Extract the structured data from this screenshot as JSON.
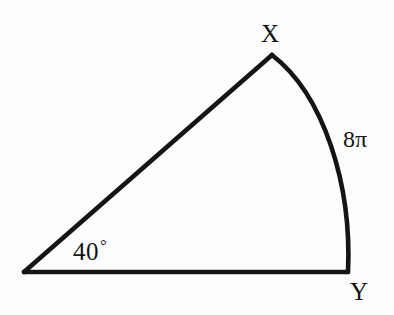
{
  "figure": {
    "kind": "circular-sector",
    "background_color": "#fdfdfd",
    "stroke_color": "#141414",
    "stroke_width": 4.6
  },
  "labels": {
    "vertex_x": "X",
    "vertex_y": "Y",
    "arc_length": "8π",
    "angle_measure": "40",
    "degree_symbol": "°"
  },
  "geometry": {
    "center_vertex": {
      "x": 24,
      "y": 272
    },
    "point_x": {
      "x": 272,
      "y": 55
    },
    "point_y": {
      "x": 348,
      "y": 272
    },
    "arc_outer_extent_x": 350,
    "arc_control_1": {
      "x": 324,
      "y": 95
    },
    "arc_control_2": {
      "x": 352,
      "y": 185
    },
    "central_angle_degrees": 40,
    "arc_length_value": "8π"
  },
  "label_positions": {
    "vertex_x": {
      "x": 261,
      "y": 21
    },
    "vertex_y": {
      "x": 350,
      "y": 279
    },
    "arc_length": {
      "x": 343,
      "y": 127
    },
    "angle_measure": {
      "x": 73,
      "y": 237
    }
  },
  "chart_data": {
    "type": "diagram",
    "title": "",
    "shape": "circular sector",
    "vertices": [
      {
        "name": "center",
        "label": "",
        "x": 24,
        "y": 272
      },
      {
        "name": "arc-start",
        "label": "X",
        "x": 272,
        "y": 55
      },
      {
        "name": "arc-end",
        "label": "Y",
        "x": 348,
        "y": 272
      }
    ],
    "edges": [
      {
        "from": "center",
        "to": "arc-start",
        "type": "straight",
        "label": ""
      },
      {
        "from": "center",
        "to": "arc-end",
        "type": "straight",
        "label": ""
      },
      {
        "from": "arc-start",
        "to": "arc-end",
        "type": "arc",
        "label": "8π"
      }
    ],
    "annotations": [
      {
        "text": "40°",
        "meaning": "central angle at center vertex"
      },
      {
        "text": "8π",
        "meaning": "length of arc XY"
      },
      {
        "text": "X",
        "meaning": "upper arc endpoint label"
      },
      {
        "text": "Y",
        "meaning": "lower-right arc endpoint label"
      }
    ]
  }
}
